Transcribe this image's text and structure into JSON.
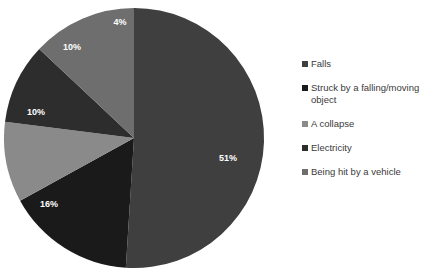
{
  "chart_data": {
    "type": "pie",
    "title": "",
    "subtitle": "",
    "xlabel": "",
    "ylabel": "",
    "grid": false,
    "legend_position": "right",
    "start_angle_deg": 0,
    "direction": "clockwise",
    "center": {
      "x": 134,
      "y": 138
    },
    "radius": 130,
    "categories": [
      "Falls",
      "Struck by a falling/moving object",
      "A collapse",
      "Electricity",
      "Being hit by a vehicle"
    ],
    "values": [
      51,
      16,
      10,
      10,
      4
    ],
    "value_unit": "%",
    "data_labels": [
      "51%",
      "16%",
      "10%",
      "10%",
      "4%"
    ],
    "colors": [
      "#3f3f3f",
      "#1a1a1a",
      "#8a8a8a",
      "#2d2d2d",
      "#6e6e6e"
    ],
    "slices": [
      {
        "label": "Falls",
        "value": 51,
        "data_label": "51%",
        "color": "#3f3f3f",
        "start_deg": 0,
        "end_deg": 183.6,
        "label_x": 228,
        "label_y": 159
      },
      {
        "label": "Struck by a falling/moving object",
        "value": 16,
        "data_label": "16%",
        "color": "#1a1a1a",
        "start_deg": 183.6,
        "end_deg": 241.2,
        "label_x": 49,
        "label_y": 205
      },
      {
        "label": "A collapse",
        "value": 10,
        "data_label": "10%",
        "color": "#8a8a8a",
        "start_deg": 241.2,
        "end_deg": 277.2,
        "label_x": 36,
        "label_y": 113
      },
      {
        "label": "Electricity",
        "value": 10,
        "data_label": "10%",
        "color": "#2d2d2d",
        "start_deg": 277.2,
        "end_deg": 313.2,
        "label_x": 72,
        "label_y": 48
      },
      {
        "label": "Being hit by a vehicle",
        "value": 4,
        "data_label": "4%",
        "color": "#6e6e6e",
        "start_deg": 313.2,
        "end_deg": 360,
        "label_x": 120,
        "label_y": 23
      }
    ]
  },
  "legend": {
    "items": [
      {
        "label": "Falls",
        "color": "#3f3f3f"
      },
      {
        "label": "Struck by a falling/moving object",
        "color": "#1a1a1a"
      },
      {
        "label": "A collapse",
        "color": "#8a8a8a"
      },
      {
        "label": "Electricity",
        "color": "#2d2d2d"
      },
      {
        "label": "Being hit by a vehicle",
        "color": "#6e6e6e"
      }
    ]
  },
  "theme": {
    "background": "#ffffff",
    "label_text_color": "#ffffff",
    "legend_text_color": "#3a3a3a"
  }
}
